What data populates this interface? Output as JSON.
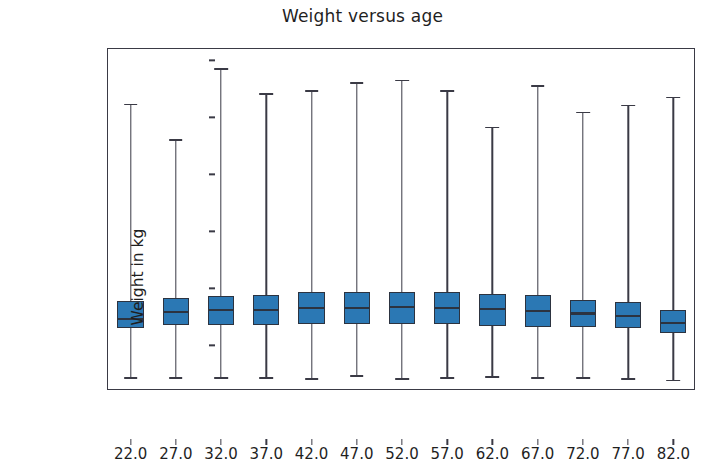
{
  "chart_data": {
    "type": "box",
    "title": "Weight versus age",
    "xlabel": "Age in years",
    "ylabel": "Weight in kg",
    "xlim": [
      19.5,
      84.5
    ],
    "ylim": [
      10,
      310
    ],
    "yticks": [
      50,
      100,
      150,
      200,
      250,
      300
    ],
    "ytick_labels": [
      "50",
      "100",
      "150",
      "200",
      "250",
      "300"
    ],
    "categories": [
      "22.0",
      "27.0",
      "32.0",
      "37.0",
      "42.0",
      "47.0",
      "52.0",
      "57.0",
      "62.0",
      "67.0",
      "72.0",
      "77.0",
      "82.0"
    ],
    "grid": false,
    "legend": false,
    "box_facecolor": "#2b78b4",
    "box_edgecolor": "#2c3340",
    "whisker_color": "#3a3a45",
    "boxes": [
      {
        "category": "22.0",
        "whisker_low": 22,
        "q1": 65,
        "median": 73,
        "q3": 89,
        "whisker_high": 262
      },
      {
        "category": "27.0",
        "whisker_low": 22,
        "q1": 68,
        "median": 79,
        "q3": 92,
        "whisker_high": 231
      },
      {
        "category": "32.0",
        "whisker_low": 22,
        "q1": 68,
        "median": 81,
        "q3": 93,
        "whisker_high": 293
      },
      {
        "category": "37.0",
        "whisker_low": 22,
        "q1": 68,
        "median": 81,
        "q3": 94,
        "whisker_high": 271
      },
      {
        "category": "42.0",
        "whisker_low": 21,
        "q1": 69,
        "median": 83,
        "q3": 97,
        "whisker_high": 274
      },
      {
        "category": "47.0",
        "whisker_low": 24,
        "q1": 69,
        "median": 83,
        "q3": 97,
        "whisker_high": 281
      },
      {
        "category": "52.0",
        "whisker_low": 21,
        "q1": 69,
        "median": 84,
        "q3": 97,
        "whisker_high": 283
      },
      {
        "category": "57.0",
        "whisker_low": 22,
        "q1": 69,
        "median": 83,
        "q3": 97,
        "whisker_high": 274
      },
      {
        "category": "62.0",
        "whisker_low": 23,
        "q1": 67,
        "median": 82,
        "q3": 95,
        "whisker_high": 242
      },
      {
        "category": "67.0",
        "whisker_low": 22,
        "q1": 66,
        "median": 80,
        "q3": 94,
        "whisker_high": 278
      },
      {
        "category": "72.0",
        "whisker_low": 22,
        "q1": 66,
        "median": 78,
        "q3": 90,
        "whisker_high": 255
      },
      {
        "category": "77.0",
        "whisker_low": 21,
        "q1": 65,
        "median": 76,
        "q3": 88,
        "whisker_high": 261
      },
      {
        "category": "82.0",
        "whisker_low": 20,
        "q1": 61,
        "median": 70,
        "q3": 81,
        "whisker_high": 268
      }
    ]
  }
}
